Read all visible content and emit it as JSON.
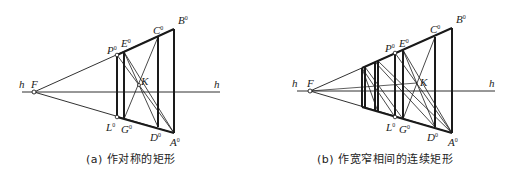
{
  "figures": [
    {
      "id": "a",
      "caption": "(a) 作对称的矩形",
      "labels": {
        "h_left": "h",
        "h_right": "h",
        "F": "F",
        "K": "K",
        "P": "P",
        "E": "E",
        "C": "C",
        "B": "B",
        "L": "L",
        "G": "G",
        "D": "D",
        "A": "A",
        "sup": "0"
      },
      "points": {
        "F": [
          34,
          92
        ],
        "B": [
          174,
          29
        ],
        "A": [
          174,
          133
        ],
        "C": [
          158,
          37
        ],
        "D": [
          158,
          127
        ],
        "P": [
          117,
          55
        ],
        "L": [
          117,
          117
        ],
        "E": [
          124,
          52
        ],
        "G": [
          124,
          119
        ],
        "K": [
          139,
          85
        ]
      },
      "horizon_y": 92
    },
    {
      "id": "b",
      "caption": "(b) 作宽窄相间的连续矩形",
      "labels": {
        "h_left": "h",
        "h_right": "h",
        "F": "F",
        "K": "K",
        "P": "P",
        "E": "E",
        "C": "C",
        "B": "B",
        "L": "L",
        "G": "G",
        "D": "D",
        "A": "A",
        "sup": "0"
      },
      "points": {
        "F": [
          310,
          91
        ],
        "B": [
          452,
          28
        ],
        "A": [
          452,
          133
        ],
        "C": [
          435,
          37
        ],
        "D": [
          435,
          127
        ],
        "P": [
          395,
          53
        ],
        "L": [
          395,
          117
        ],
        "E": [
          403,
          50
        ],
        "G": [
          403,
          119
        ],
        "K": [
          417,
          83
        ]
      },
      "extra_verticals_x": [
        362,
        365,
        375,
        378
      ],
      "horizon_y": 91
    }
  ]
}
